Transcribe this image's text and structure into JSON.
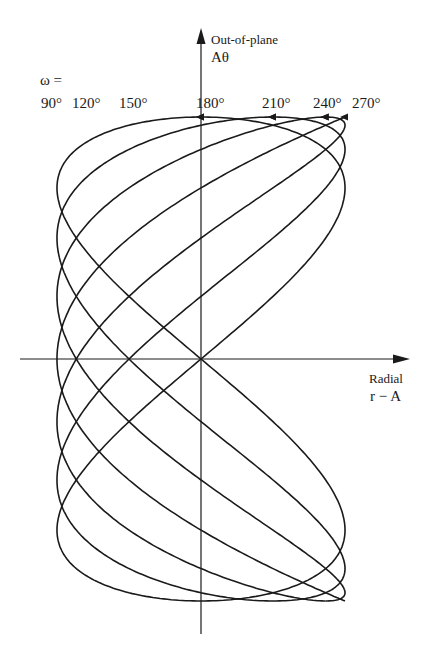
{
  "chart_data": {
    "type": "line",
    "title": "",
    "xlabel": "Radial r − A",
    "ylabel": "Out-of-plane Aθ",
    "grid": false,
    "legend_prefix": "ω =",
    "series": [
      {
        "name": "90°",
        "omega": 90
      },
      {
        "name": "120°",
        "omega": 120
      },
      {
        "name": "150°",
        "omega": 150
      },
      {
        "name": "180°",
        "omega": 180
      },
      {
        "name": "210°",
        "omega": 210
      },
      {
        "name": "240°",
        "omega": 240
      },
      {
        "name": "270°",
        "omega": 270
      }
    ]
  },
  "axes": {
    "y_label_line1": "Out-of-plane",
    "y_label_line2": "Aθ",
    "x_label_line1": "Radial",
    "x_label_line2": "r − A"
  },
  "omega_prefix": "ω =",
  "omega_labels": [
    "90°",
    "120°",
    "150°",
    "180°",
    "210°",
    "240°",
    "270°"
  ],
  "colors": {
    "ink": "#1a1a1a",
    "background": "#ffffff"
  }
}
